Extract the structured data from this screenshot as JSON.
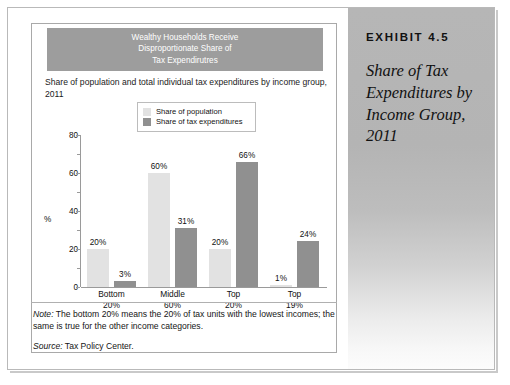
{
  "exhibit": {
    "number": "EXHIBIT 4.5",
    "title": "Share of Tax Expenditures by Income Group, 2011"
  },
  "chart_data": {
    "type": "bar",
    "title": "Wealthy Households Receive Disproportionate Share of Tax Expendirutres",
    "title_lines": [
      "Wealthy Households Receive",
      "Disproportionate Share of",
      "Tax Expendirutres"
    ],
    "subtitle": "Share of population and total individual tax expenditures by income group, 2011",
    "categories": [
      "Bottom 20%",
      "Middle 60%",
      "Top 20%",
      "Top 19%"
    ],
    "category_lines": [
      [
        "Bottom",
        "20%"
      ],
      [
        "Middle",
        "60%"
      ],
      [
        "Top",
        "20%"
      ],
      [
        "Top",
        "19%"
      ]
    ],
    "series": [
      {
        "name": "Share of population",
        "color": "#e2e2e2",
        "values": [
          20,
          60,
          20,
          1
        ],
        "labels": [
          "20%",
          "60%",
          "20%",
          "1%"
        ]
      },
      {
        "name": "Share of tax expenditures",
        "color": "#909090",
        "values": [
          3,
          31,
          66,
          24
        ],
        "labels": [
          "3%",
          "31%",
          "66%",
          "24%"
        ]
      }
    ],
    "xlabel": "",
    "ylabel": "%",
    "ylim": [
      0,
      80
    ],
    "yticks": [
      0,
      20,
      40,
      60,
      80
    ],
    "ytick_labels": [
      "0",
      "20",
      "40",
      "60",
      "80"
    ],
    "grid": false,
    "legend_position": "top-center"
  },
  "notes": {
    "note_label": "Note:",
    "note_body": " The bottom 20% means the 20% of tax units with the lowest incomes; the same is true for the other income categories.",
    "source_label": "Source:",
    "source_body": " Tax Policy Center."
  },
  "colors": {
    "title_band": "#9d9d9d",
    "population_bar": "#e2e2e2",
    "tax_bar": "#909090",
    "axis": "#9a9a9a",
    "panel_top": "#b6b6b6"
  }
}
